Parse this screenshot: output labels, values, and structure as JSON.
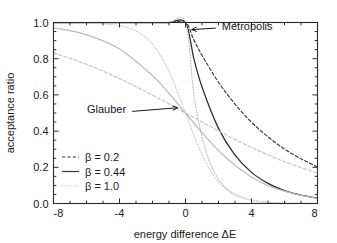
{
  "chart_data": {
    "type": "line",
    "title": "",
    "xlabel": "energy difference ΔE",
    "ylabel": "acceptance ratio",
    "xlim": [
      -8,
      8
    ],
    "ylim": [
      0.0,
      1.0
    ],
    "grid": false,
    "xticks": [
      -8,
      -4,
      0,
      4,
      8
    ],
    "xtick_labels": [
      "-8",
      "-4",
      "0",
      "4",
      "8"
    ],
    "xminor_step": 1,
    "yticks": [
      0.0,
      0.2,
      0.4,
      0.6,
      0.8,
      1.0
    ],
    "ytick_labels": [
      "0.0",
      "0.2",
      "0.4",
      "0.6",
      "0.8",
      "1.0"
    ],
    "yminor_step": 0.05,
    "legend": {
      "position": "lower-left-inside",
      "entries": [
        {
          "label": "β = 0.2",
          "style": "dashed",
          "color": "#3a3a3a"
        },
        {
          "label": "β = 0.44",
          "style": "solid",
          "color": "#3a3a3a"
        },
        {
          "label": "β = 1.0",
          "style": "dotted",
          "color": "#b8b8b8"
        }
      ]
    },
    "annotations": [
      {
        "text": "Metropolis",
        "x": 2.2,
        "y": 0.98,
        "arrow_to_x": 0.25,
        "arrow_to_y": 0.96
      },
      {
        "text": "Glauber",
        "x": -3.6,
        "y": 0.52,
        "arrow_to_x": -0.35,
        "arrow_to_y": 0.53
      }
    ],
    "families": [
      {
        "name": "Metropolis",
        "formula": "min(1, exp(-beta*dE))",
        "color_solid": "#2b2b2b",
        "series": [
          {
            "name": "Metropolis beta = 0.2",
            "beta": 0.2,
            "style": "dashed",
            "color": "#3a3a3a",
            "x": [
              -8,
              -6,
              -4,
              -2,
              -1,
              0,
              0.5,
              1,
              2,
              3,
              4,
              5,
              6,
              7,
              8
            ],
            "y": [
              1.0,
              1.0,
              1.0,
              1.0,
              1.0,
              1.0,
              0.905,
              0.819,
              0.67,
              0.549,
              0.449,
              0.368,
              0.301,
              0.247,
              0.202
            ]
          },
          {
            "name": "Metropolis beta = 0.44",
            "beta": 0.44,
            "style": "solid",
            "color": "#2b2b2b",
            "x": [
              -8,
              -6,
              -4,
              -2,
              -1,
              0,
              0.5,
              1,
              2,
              3,
              4,
              5,
              6,
              7,
              8
            ],
            "y": [
              1.0,
              1.0,
              1.0,
              1.0,
              1.0,
              1.0,
              0.803,
              0.644,
              0.415,
              0.267,
              0.172,
              0.111,
              0.071,
              0.046,
              0.03
            ]
          },
          {
            "name": "Metropolis beta = 1.0",
            "beta": 1.0,
            "style": "dotted",
            "color": "#c0c0c0",
            "x": [
              -8,
              -6,
              -4,
              -2,
              -1,
              0,
              0.5,
              1,
              1.5,
              2,
              2.5,
              3,
              4,
              5,
              6,
              7,
              8
            ],
            "y": [
              1.0,
              1.0,
              1.0,
              1.0,
              1.0,
              1.0,
              0.607,
              0.368,
              0.223,
              0.135,
              0.082,
              0.05,
              0.018,
              0.007,
              0.002,
              0.001,
              0.0
            ]
          }
        ]
      },
      {
        "name": "Glauber",
        "formula": "1/(1+exp(beta*dE))",
        "color_solid": "#bcbcbc",
        "series": [
          {
            "name": "Glauber beta = 0.2",
            "beta": 0.2,
            "style": "dashed",
            "color": "#c4c4c4",
            "x": [
              -8,
              -6,
              -4,
              -2,
              0,
              2,
              4,
              6,
              8
            ],
            "y": [
              0.832,
              0.769,
              0.69,
              0.599,
              0.5,
              0.401,
              0.31,
              0.231,
              0.168
            ]
          },
          {
            "name": "Glauber beta = 0.44",
            "beta": 0.44,
            "style": "solid",
            "color": "#bcbcbc",
            "x": [
              -8,
              -6,
              -4,
              -2,
              -1,
              0,
              1,
              2,
              3,
              4,
              5,
              6,
              7,
              8
            ],
            "y": [
              0.971,
              0.932,
              0.854,
              0.707,
              0.608,
              0.5,
              0.392,
              0.293,
              0.211,
              0.146,
              0.099,
              0.068,
              0.045,
              0.029
            ]
          },
          {
            "name": "Glauber beta = 1.0",
            "beta": 1.0,
            "style": "dotted",
            "color": "#cfcfcf",
            "x": [
              -8,
              -6,
              -5,
              -4,
              -3,
              -2,
              -1,
              0,
              1,
              2,
              3,
              4,
              5,
              6,
              8
            ],
            "y": [
              1.0,
              0.998,
              0.993,
              0.982,
              0.953,
              0.881,
              0.731,
              0.5,
              0.269,
              0.119,
              0.047,
              0.018,
              0.007,
              0.002,
              0.0
            ]
          }
        ]
      }
    ]
  }
}
